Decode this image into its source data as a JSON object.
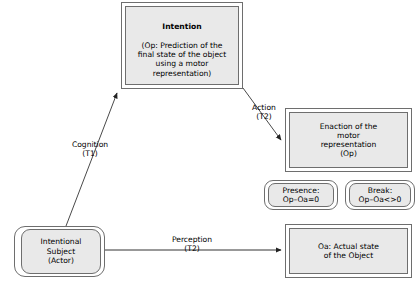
{
  "diagram": {
    "background": "#ffffff",
    "stroke_color": "#6e6e6e",
    "node_fill": "#e9e9e9",
    "text_color": "#000000"
  },
  "nodes": {
    "intention": {
      "heading": "Intention",
      "body": "(Op: Prediction of the\nfinal state of the object\nusing a motor\nrepresentation)",
      "shape": "rectangle"
    },
    "enaction": {
      "text": "Enaction of the\nmotor\nrepresentation\n(Op)",
      "shape": "rectangle"
    },
    "presence": {
      "text": "Presence:\nOp–Oa=0",
      "shape": "rounded"
    },
    "break": {
      "text": "Break:\nOp–Oa<>0",
      "shape": "rounded"
    },
    "subject": {
      "text": "Intentional\nSubject\n(Actor)",
      "shape": "rounded"
    },
    "object_state": {
      "text": "Oa: Actual state\nof the Object",
      "shape": "rectangle"
    }
  },
  "edges": {
    "cognition": {
      "label": "Cognition\n(T1)",
      "from": "subject",
      "to": "intention",
      "arrow": "arrowhead"
    },
    "action": {
      "label": "Action\n(T2)",
      "from": "intention",
      "to": "enaction",
      "arrow": "arrowhead"
    },
    "perception": {
      "label": "Perception\n(T2)",
      "from": "subject",
      "to": "object_state",
      "arrow": "arrowhead"
    }
  }
}
